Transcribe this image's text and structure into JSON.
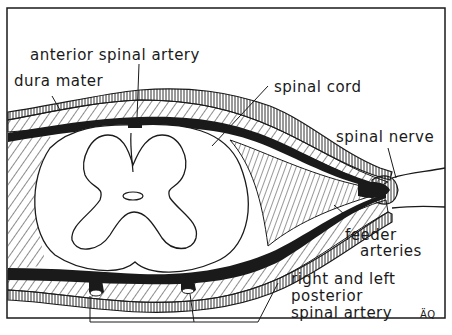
{
  "diagram": {
    "labels": {
      "anterior_spinal_artery": "anterior spinal artery",
      "dura_mater": "dura mater",
      "spinal_cord": "spinal cord",
      "spinal_nerve": "spinal nerve",
      "feeder_arteries_line1": "feeder",
      "feeder_arteries_line2": "arteries",
      "posterior_line1": "right and left",
      "posterior_line2": "posterior",
      "posterior_line3": "spinal artery"
    },
    "artist_initials": "ÄQ",
    "colors": {
      "ink": "#1a1a1a",
      "paper": "#ffffff"
    }
  }
}
